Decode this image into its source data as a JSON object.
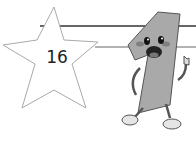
{
  "badge": {
    "number": "16",
    "shape": "star"
  },
  "mascot": {
    "label": "number-one-character",
    "color": "#a9a9a9"
  },
  "colors": {
    "line_dark": "#333333",
    "line_light": "#9a9a9a",
    "star_stroke": "#aaaaaa"
  }
}
